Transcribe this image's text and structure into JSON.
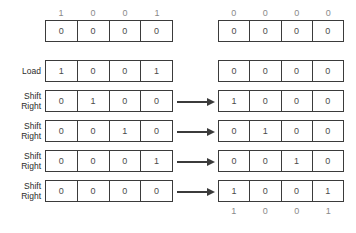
{
  "diagram": {
    "colors": {
      "border": "#3b3b3b",
      "cell_text": "#4a4a4a",
      "label_text": "#2b2b2b",
      "annotation_text": "#8a8a8a",
      "background": "#ffffff"
    },
    "header": {
      "left_digits": [
        "1",
        "0",
        "0",
        "1"
      ],
      "right_digits": [
        "0",
        "0",
        "0",
        "0"
      ]
    },
    "footer": {
      "right_digits": [
        "1",
        "0",
        "0",
        "1"
      ]
    },
    "rows": [
      {
        "label_line1": "",
        "label_line2": "",
        "left_cells": [
          "0",
          "0",
          "0",
          "0"
        ],
        "right_cells": [
          "0",
          "0",
          "0",
          "0"
        ],
        "arrow": false
      },
      {
        "label_line1": "Load",
        "label_line2": "",
        "left_cells": [
          "1",
          "0",
          "0",
          "1"
        ],
        "right_cells": [
          "0",
          "0",
          "0",
          "0"
        ],
        "arrow": false
      },
      {
        "label_line1": "Shift",
        "label_line2": "Right",
        "left_cells": [
          "0",
          "1",
          "0",
          "0"
        ],
        "right_cells": [
          "1",
          "0",
          "0",
          "0"
        ],
        "arrow": true
      },
      {
        "label_line1": "Shift",
        "label_line2": "Right",
        "left_cells": [
          "0",
          "0",
          "1",
          "0"
        ],
        "right_cells": [
          "0",
          "1",
          "0",
          "0"
        ],
        "arrow": true
      },
      {
        "label_line1": "Shift",
        "label_line2": "Right",
        "left_cells": [
          "0",
          "0",
          "0",
          "1"
        ],
        "right_cells": [
          "0",
          "0",
          "1",
          "0"
        ],
        "arrow": true
      },
      {
        "label_line1": "Shift",
        "label_line2": "Right",
        "left_cells": [
          "0",
          "0",
          "0",
          "0"
        ],
        "right_cells": [
          "1",
          "0",
          "0",
          "1"
        ],
        "arrow": true
      }
    ]
  }
}
